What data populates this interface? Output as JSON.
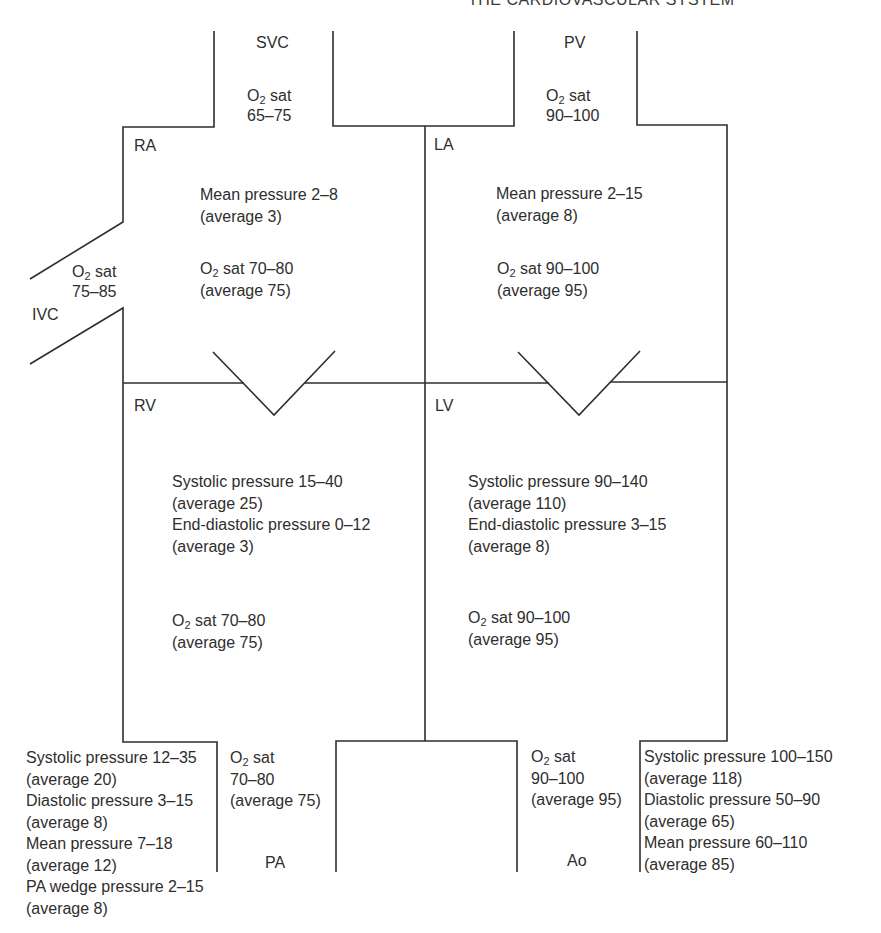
{
  "running_head": {
    "title": "THE CARDIOVASCULAR SYSTEM",
    "page": ""
  },
  "figure": {
    "type": "heart-chamber-schematic",
    "colors": {
      "line": "#2e2e2e",
      "text": "#2e2e2e",
      "background": "#ffffff"
    },
    "o2_prefix": "O",
    "o2_subscript": "2",
    "structures": {
      "svc": {
        "label": "SVC",
        "o2_sat": {
          "suffix": " sat",
          "range": "65–75"
        }
      },
      "ivc": {
        "label": "IVC",
        "o2_sat": {
          "suffix": " sat",
          "range": "75–85"
        }
      },
      "pv": {
        "label": "PV",
        "o2_sat": {
          "suffix": " sat",
          "range": "90–100"
        }
      },
      "ra": {
        "label": "RA",
        "mean_pressure": "Mean pressure 2–8",
        "mean_pressure_avg": "(average 3)",
        "o2_sat": " sat 70–80",
        "o2_sat_avg": "(average 75)"
      },
      "la": {
        "label": "LA",
        "mean_pressure": "Mean pressure 2–15",
        "mean_pressure_avg": "(average 8)",
        "o2_sat": " sat 90–100",
        "o2_sat_avg": "(average 95)"
      },
      "rv": {
        "label": "RV",
        "systolic": "Systolic pressure 15–40",
        "systolic_avg": "(average 25)",
        "end_diastolic": "End-diastolic pressure 0–12",
        "end_diastolic_avg": "(average 3)",
        "o2_sat": " sat 70–80",
        "o2_sat_avg": "(average 75)"
      },
      "lv": {
        "label": "LV",
        "systolic": "Systolic pressure 90–140",
        "systolic_avg": "(average 110)",
        "end_diastolic": "End-diastolic pressure 3–15",
        "end_diastolic_avg": "(average 8)",
        "o2_sat": " sat 90–100",
        "o2_sat_avg": "(average 95)"
      },
      "pa": {
        "label": "PA",
        "o2_sat": {
          "suffix": " sat",
          "range": "70–80",
          "avg": "(average 75)"
        },
        "pressures": [
          "Systolic pressure 12–35",
          "(average 20)",
          "Diastolic pressure 3–15",
          "(average 8)",
          "Mean pressure 7–18",
          "(average 12)",
          "PA wedge pressure 2–15",
          "(average 8)"
        ]
      },
      "ao": {
        "label": "Ao",
        "o2_sat": {
          "suffix": " sat",
          "range": "90–100",
          "avg": "(average 95)"
        },
        "pressures": [
          "Systolic pressure 100–150",
          "(average 118)",
          "Diastolic pressure 50–90",
          "(average 65)",
          "Mean pressure 60–110",
          "(average 85)"
        ]
      }
    }
  }
}
